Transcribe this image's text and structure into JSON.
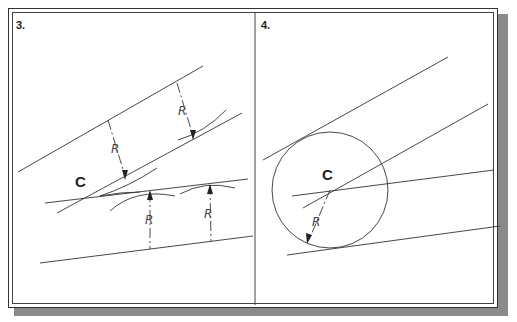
{
  "panels": [
    {
      "label": "3.",
      "center_label": "C",
      "radius_labels": [
        "R",
        "R",
        "R",
        "R"
      ]
    },
    {
      "label": "4.",
      "center_label": "C",
      "radius_labels": [
        "R"
      ]
    }
  ],
  "colors": {
    "line": "#333333",
    "frame": "#333333",
    "shadow": "#8a8a8a",
    "background": "#ffffff"
  }
}
